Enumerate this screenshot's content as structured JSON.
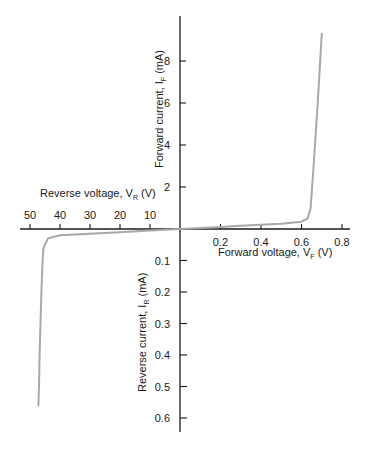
{
  "chart_data": {
    "type": "line",
    "title": "",
    "colors": {
      "axis": "#1a1a1a",
      "curve": "#a8a8a8",
      "background": "#ffffff"
    },
    "quadrants": {
      "forward": {
        "xlabel": "Forward voltage, V",
        "xlabel_sub": "F",
        "xlabel_unit": " (V)",
        "ylabel": "Forward current, I",
        "ylabel_sub": "F",
        "ylabel_unit": " (mA)",
        "x_ticks": [
          "0.2",
          "0.4",
          "0.6",
          "0.8"
        ],
        "x_tick_values": [
          0.2,
          0.4,
          0.6,
          0.8
        ],
        "y_ticks": [
          "2",
          "4",
          "6",
          "8"
        ],
        "y_tick_values": [
          2,
          4,
          6,
          8
        ],
        "xlim": [
          0,
          0.8
        ],
        "ylim": [
          0,
          9.5
        ]
      },
      "reverse": {
        "xlabel": "Reverse voltage, V",
        "xlabel_sub": "R",
        "xlabel_unit": " (V)",
        "ylabel": "Reverse current, I",
        "ylabel_sub": "R",
        "ylabel_unit": " (mA)",
        "x_ticks": [
          "50",
          "40",
          "30",
          "20",
          "10"
        ],
        "x_tick_values": [
          50,
          40,
          30,
          20,
          10
        ],
        "y_ticks": [
          "0.1",
          "0.2",
          "0.3",
          "0.4",
          "0.5",
          "0.6"
        ],
        "y_tick_values": [
          0.1,
          0.2,
          0.3,
          0.4,
          0.5,
          0.6
        ],
        "xlim": [
          0,
          50
        ],
        "ylim": [
          0,
          0.65
        ]
      }
    },
    "series": [
      {
        "name": "Forward characteristic",
        "x_label": "V_F (V)",
        "y_label": "I_F (mA)",
        "points": [
          [
            0,
            0
          ],
          [
            0.1,
            0.05
          ],
          [
            0.2,
            0.1
          ],
          [
            0.3,
            0.15
          ],
          [
            0.4,
            0.2
          ],
          [
            0.5,
            0.25
          ],
          [
            0.6,
            0.35
          ],
          [
            0.63,
            0.5
          ],
          [
            0.645,
            1.0
          ],
          [
            0.66,
            3.0
          ],
          [
            0.68,
            6.0
          ],
          [
            0.7,
            9.3
          ]
        ]
      },
      {
        "name": "Reverse characteristic",
        "x_label": "V_R (V)",
        "y_label": "I_R (mA)",
        "points": [
          [
            0,
            0
          ],
          [
            10,
            0.005
          ],
          [
            20,
            0.01
          ],
          [
            30,
            0.015
          ],
          [
            40,
            0.02
          ],
          [
            44,
            0.03
          ],
          [
            45.5,
            0.06
          ],
          [
            45.8,
            0.1
          ],
          [
            46.2,
            0.2
          ],
          [
            46.5,
            0.3
          ],
          [
            46.8,
            0.4
          ],
          [
            47.0,
            0.5
          ],
          [
            47.2,
            0.56
          ]
        ]
      }
    ],
    "grid": false,
    "legend": null
  }
}
